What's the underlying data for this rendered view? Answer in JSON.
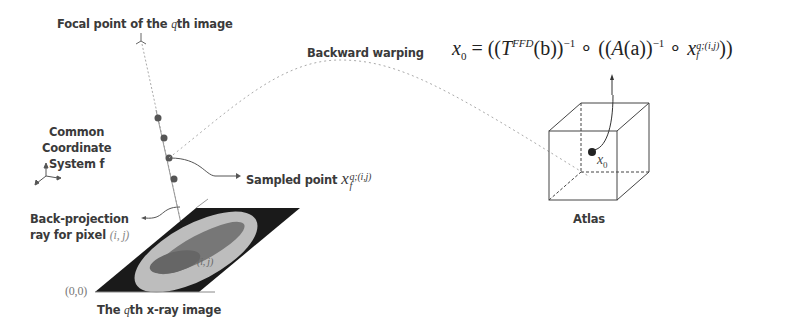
{
  "labels": {
    "focal_point": "Focal point of the ",
    "focal_point_q": "q",
    "focal_point_suffix": "th image",
    "coord_system_line1": "Common",
    "coord_system_line2": "Coordinate",
    "coord_system_line3": "System f",
    "backprojection_line1": "Back-projection",
    "backprojection_line2": "ray for pixel ",
    "pixel_index": "(i, j)",
    "origin": "(0,0)",
    "xray_image_prefix": "The ",
    "xray_image_q": "q",
    "xray_image_suffix": "th x-ray image",
    "sampled_point": "Sampled point ",
    "sampled_point_symbol": "x",
    "sampled_point_sup": "q;(i,j)",
    "sampled_point_sub": "f",
    "backward_warping": "Backward warping",
    "atlas": "Atlas",
    "atlas_point": "x",
    "atlas_point_sub": "0",
    "pixel_mark": "(i, j)"
  },
  "equation": {
    "lhs": "x",
    "lhs_sub": "0",
    "eq": " = ((",
    "T": "T",
    "T_sup": "FFD",
    "b": "(b))",
    "inv1": "−1",
    "compose1": " ∘ ((",
    "A": "A",
    "a": "(a))",
    "inv2": "−1",
    "compose2": " ∘ ",
    "x": "x",
    "x_sup": "q;(i,j)",
    "x_sub": "f",
    "close": "))"
  },
  "colors": {
    "dot": "#555555",
    "line": "#888888",
    "xray_bg": "#1a1a1a",
    "text": "#3a3a3a"
  }
}
